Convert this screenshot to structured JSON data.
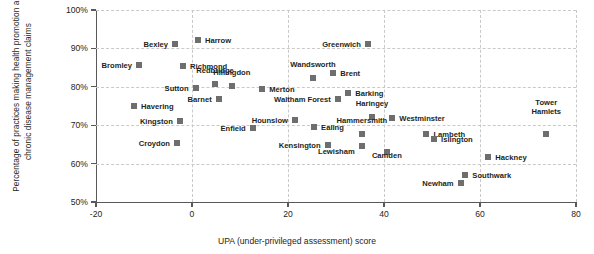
{
  "chart_data": {
    "type": "scatter",
    "title": "",
    "xlabel": "UPA (under-privileged assessment) score",
    "ylabel": "Percentage of practices making health promotion and chronic disease management claims",
    "xlim": [
      -20,
      80
    ],
    "ylim": [
      50,
      100
    ],
    "xticks": [
      "-20",
      "0",
      "20",
      "40",
      "60",
      "80"
    ],
    "xtick_values": [
      -20,
      0,
      20,
      40,
      60,
      80
    ],
    "yticks": [
      "50%",
      "60%",
      "70%",
      "80%",
      "90%",
      "100%"
    ],
    "ytick_values": [
      50,
      60,
      70,
      80,
      90,
      100
    ],
    "grid": true,
    "grid_style": "dashed",
    "legend": "none",
    "marker_color": "#6e6e6e",
    "axis_color": "#595959",
    "grid_color": "#c9c9c9",
    "points": [
      {
        "label": "Bromley",
        "x": -11.0,
        "y": 85.7,
        "lx": -12.5,
        "ly": 85.7,
        "pos": "left"
      },
      {
        "label": "Bexley",
        "x": -3.5,
        "y": 91.2,
        "lx": -5.0,
        "ly": 91.2,
        "pos": "left"
      },
      {
        "label": "Harrow",
        "x": 1.2,
        "y": 92.2,
        "lx": 2.7,
        "ly": 92.2,
        "pos": "right"
      },
      {
        "label": "Richmond",
        "x": -1.9,
        "y": 85.4,
        "lx": -0.4,
        "ly": 85.4,
        "pos": "right"
      },
      {
        "label": "Redbridge",
        "x": 4.8,
        "y": 80.7,
        "lx": 4.8,
        "ly": 83.0,
        "pos": "above"
      },
      {
        "label": "Hillingdon",
        "x": 8.3,
        "y": 80.2,
        "lx": 8.3,
        "ly": 82.6,
        "pos": "above"
      },
      {
        "label": "Sutton",
        "x": 0.8,
        "y": 79.7,
        "lx": -0.7,
        "ly": 79.7,
        "pos": "left"
      },
      {
        "label": "Merton",
        "x": 14.6,
        "y": 79.4,
        "lx": 16.1,
        "ly": 79.4,
        "pos": "right"
      },
      {
        "label": "Wandsworth",
        "x": 25.2,
        "y": 82.3,
        "lx": 25.2,
        "ly": 84.6,
        "pos": "above"
      },
      {
        "label": "Brent",
        "x": 29.4,
        "y": 83.6,
        "lx": 30.9,
        "ly": 83.6,
        "pos": "right"
      },
      {
        "label": "Greenwich",
        "x": 36.7,
        "y": 91.1,
        "lx": 35.2,
        "ly": 91.1,
        "pos": "left"
      },
      {
        "label": "Barking",
        "x": 32.5,
        "y": 78.4,
        "lx": 34.0,
        "ly": 78.4,
        "pos": "right"
      },
      {
        "label": "Barnet",
        "x": 5.6,
        "y": 76.8,
        "lx": 4.1,
        "ly": 76.8,
        "pos": "left"
      },
      {
        "label": "Havering",
        "x": -12.1,
        "y": 75.0,
        "lx": -10.6,
        "ly": 75.0,
        "pos": "right"
      },
      {
        "label": "Waltham Forest",
        "x": 30.4,
        "y": 76.8,
        "lx": 28.9,
        "ly": 76.8,
        "pos": "left"
      },
      {
        "label": "Kingston",
        "x": -2.5,
        "y": 71.1,
        "lx": -4.0,
        "ly": 71.1,
        "pos": "left"
      },
      {
        "label": "Hounslow",
        "x": 21.5,
        "y": 71.4,
        "lx": 20.0,
        "ly": 71.4,
        "pos": "left"
      },
      {
        "label": "Ealing",
        "x": 25.4,
        "y": 69.6,
        "lx": 26.9,
        "ly": 69.6,
        "pos": "right"
      },
      {
        "label": "Haringey",
        "x": 37.5,
        "y": 72.1,
        "lx": 37.5,
        "ly": 74.5,
        "pos": "above"
      },
      {
        "label": "Westminster",
        "x": 41.7,
        "y": 71.9,
        "lx": 43.2,
        "ly": 71.9,
        "pos": "right"
      },
      {
        "label": "Hammersmith",
        "x": 35.4,
        "y": 67.7,
        "lx": 35.4,
        "ly": 70.1,
        "pos": "above"
      },
      {
        "label": "Lambeth",
        "x": 48.8,
        "y": 67.7,
        "lx": 50.3,
        "ly": 67.7,
        "pos": "right"
      },
      {
        "label": "Islington",
        "x": 50.4,
        "y": 66.4,
        "lx": 51.9,
        "ly": 66.4,
        "pos": "right"
      },
      {
        "label": "Tower Hamlets",
        "x": 73.8,
        "y": 67.7,
        "lx": 73.8,
        "ly": 72.4,
        "pos": "above2"
      },
      {
        "label": "Enfield",
        "x": 12.7,
        "y": 69.3,
        "lx": 11.2,
        "ly": 69.3,
        "pos": "left"
      },
      {
        "label": "Kensington",
        "x": 28.3,
        "y": 64.8,
        "lx": 26.8,
        "ly": 64.8,
        "pos": "left"
      },
      {
        "label": "Croydon",
        "x": -3.1,
        "y": 65.4,
        "lx": -4.6,
        "ly": 65.4,
        "pos": "left"
      },
      {
        "label": "Lewisham",
        "x": 35.4,
        "y": 64.6,
        "lx": 33.9,
        "ly": 63.3,
        "pos": "left"
      },
      {
        "label": "Camden",
        "x": 40.6,
        "y": 63.0,
        "lx": 40.6,
        "ly": 60.9,
        "pos": "below"
      },
      {
        "label": "Hackney",
        "x": 61.7,
        "y": 61.7,
        "lx": 63.2,
        "ly": 61.7,
        "pos": "right"
      },
      {
        "label": "Southwark",
        "x": 56.9,
        "y": 57.0,
        "lx": 58.4,
        "ly": 57.0,
        "pos": "right"
      },
      {
        "label": "Newham",
        "x": 56.0,
        "y": 55.0,
        "lx": 54.5,
        "ly": 55.0,
        "pos": "left"
      }
    ]
  }
}
